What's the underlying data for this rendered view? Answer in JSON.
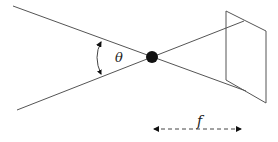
{
  "diagram": {
    "angle_label": "θ",
    "focal_length_label": "f",
    "elements": {
      "pinhole": "center of projection",
      "image_plane": "image plane",
      "rays": [
        "upper ray",
        "lower ray"
      ],
      "angle_arc": "field-of-view angle",
      "focal_arrow": "focal length dimension"
    },
    "colors": {
      "line": "#555555",
      "dot": "#111111",
      "text": "#222222"
    }
  }
}
